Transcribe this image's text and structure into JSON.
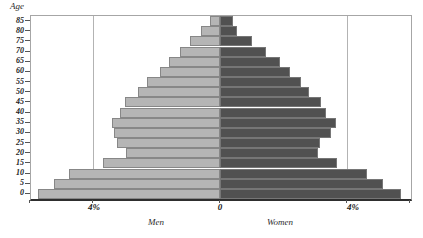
{
  "chart_data": {
    "type": "bar",
    "subtype": "population-pyramid",
    "title": "",
    "ylabel": "Age",
    "xlabel": "",
    "age_groups": [
      "85",
      "80",
      "75",
      "70",
      "65",
      "60",
      "55",
      "50",
      "45",
      "40",
      "35",
      "30",
      "25",
      "20",
      "15",
      "10",
      "5",
      "0"
    ],
    "series": [
      {
        "name": "Men",
        "side": "left",
        "values_pct": [
          0.3,
          0.6,
          0.95,
          1.25,
          1.6,
          1.9,
          2.3,
          2.6,
          3.0,
          3.15,
          3.4,
          3.35,
          3.25,
          2.95,
          3.7,
          4.75,
          5.25,
          5.75
        ]
      },
      {
        "name": "Women",
        "side": "right",
        "values_pct": [
          0.4,
          0.55,
          1.0,
          1.45,
          1.9,
          2.2,
          2.55,
          2.8,
          3.2,
          3.35,
          3.65,
          3.5,
          3.15,
          3.1,
          3.7,
          4.65,
          5.15,
          5.7
        ]
      }
    ],
    "x_axis": {
      "unit": "%",
      "range_pct": [
        -6,
        6
      ],
      "gridlines_pct": [
        -4,
        4
      ],
      "tick_labels": [
        "4%",
        "0",
        "4%"
      ]
    },
    "grid": "vertical-only",
    "legend_position": "below-x-axis"
  },
  "colors": {
    "men_bar": "#b5b5b5",
    "men_bar_border": "#878787",
    "women_bar": "#515151",
    "women_bar_border": "#767676",
    "gridline": "#b3b3b3",
    "plot_border": "#a6a6a6",
    "axis_line": "#2e2e2e",
    "text": "#222222",
    "background": "#ffffff"
  }
}
